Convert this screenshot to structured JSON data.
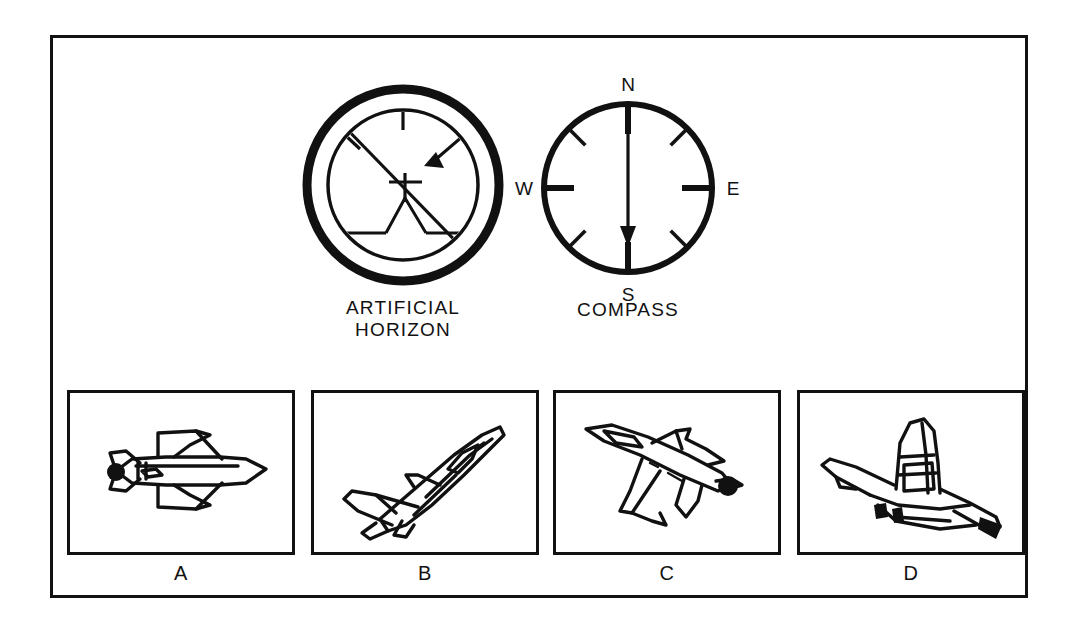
{
  "figure": {
    "background_color": "#ffffff",
    "line_color": "#111111",
    "frame_border_color": "#111111"
  },
  "instruments": [
    {
      "id": "artificial-horizon",
      "caption": "ARTIFICIAL\nHORIZON",
      "reading": "banked right, nose level",
      "pointer_position": "upper-right"
    },
    {
      "id": "compass",
      "caption": "COMPASS",
      "labels": {
        "north": "N",
        "east": "E",
        "south": "S",
        "west": "W"
      },
      "needle_heading": "S",
      "major_ticks": [
        "N",
        "E",
        "S",
        "W"
      ],
      "minor_ticks": [
        "NE",
        "SE",
        "SW",
        "NW"
      ]
    }
  ],
  "panels": [
    {
      "label": "A",
      "aircraft": "jet-top-view-level-nose-right"
    },
    {
      "label": "B",
      "aircraft": "jet-climbing-up-right"
    },
    {
      "label": "C",
      "aircraft": "jet-descending-nose-lower-right"
    },
    {
      "label": "D",
      "aircraft": "jet-front-view-nose-toward-viewer"
    }
  ]
}
